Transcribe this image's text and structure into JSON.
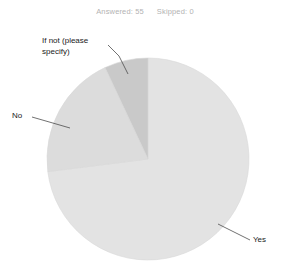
{
  "header": {
    "answered_label": "Answered: 55",
    "skipped_label": "Skipped: 0"
  },
  "chart_data": {
    "type": "pie",
    "title": "",
    "categories": [
      "Yes",
      "No",
      "If not (please specify)"
    ],
    "values": [
      73,
      20,
      7
    ],
    "value_unit": "percent",
    "labels": {
      "yes": "Yes",
      "no": "No",
      "if_not": "If not (please specify)",
      "if_not_line1": "If not (please",
      "if_not_line2": "specify)"
    },
    "colors": {
      "yes": "#e3e3e3",
      "no": "#dcdcdc",
      "if_not": "#c9c9c9",
      "stroke": "#d0d0d0",
      "leader_line": "#4d4d4d",
      "label_text": "#1a1a1a",
      "stats_text": "#b3b3b3",
      "background": "#ffffff"
    },
    "geometry": {
      "center_x": 148,
      "center_y": 159,
      "radius": 101
    },
    "legend_position": "callout-labels",
    "grid": false
  }
}
